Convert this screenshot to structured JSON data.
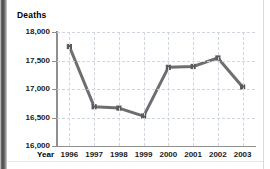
{
  "chart_data": {
    "type": "line",
    "title": "",
    "ylabel": "Deaths",
    "xlabel": "Year",
    "categories": [
      "1996",
      "1997",
      "1998",
      "1999",
      "2000",
      "2001",
      "2002",
      "2003"
    ],
    "values": [
      17745,
      16690,
      16665,
      16525,
      17380,
      17395,
      17545,
      17035
    ],
    "series": [
      {
        "name": "Deaths",
        "values": [
          17745,
          16690,
          16665,
          16525,
          17380,
          17395,
          17545,
          17035
        ]
      }
    ],
    "ylim": [
      16000,
      18000
    ],
    "ytick_values": [
      16000,
      16500,
      17000,
      17500,
      18000
    ],
    "ytick_labels": [
      "16,000",
      "16,500",
      "17,000",
      "17,500",
      "18,000"
    ],
    "grid": true,
    "grid_style": "dashed",
    "legend": "none",
    "marker": "square",
    "line_color": "#6e6e6e",
    "marker_color": "#5a5a5a",
    "grid_color": "#cfd6e0",
    "axis_color": "#8f8f8f",
    "text_color": "#1a1a1a"
  }
}
